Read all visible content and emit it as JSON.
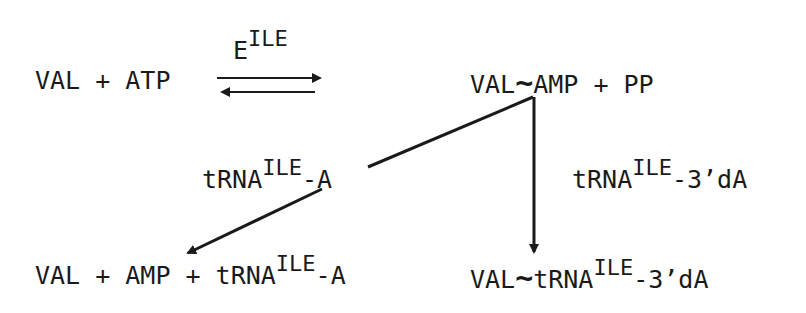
{
  "reaction": {
    "enzyme": {
      "base": "E",
      "sup": "ILE"
    },
    "reactants": "VAL + ATP",
    "intermediate": {
      "left": "VAL",
      "bond": "~",
      "right": "AMP + PP"
    },
    "branch_left": {
      "label_base": "tRNA",
      "label_sup": "ILE",
      "label_suffix": "-A"
    },
    "branch_right": {
      "label_base": "tRNA",
      "label_sup": "ILE",
      "label_suffix": "-3’dA"
    },
    "product_left": {
      "prefix": "VAL + AMP + tRNA",
      "sup": "ILE",
      "suffix": "-A"
    },
    "product_right": {
      "left": "VAL",
      "bond": "~",
      "base": "tRNA",
      "sup": "ILE",
      "suffix": "-3’dA"
    }
  },
  "colors": {
    "ink": "#1a1a1a",
    "background": "#ffffff"
  }
}
